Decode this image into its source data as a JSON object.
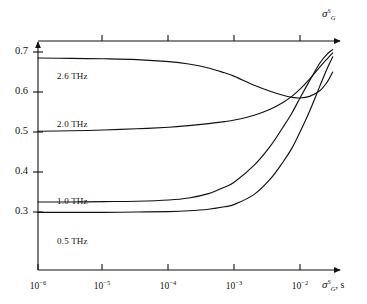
{
  "figure": {
    "background": "#ffffff",
    "line_color": "#111111",
    "axis_color": "#111111"
  },
  "axes": {
    "top_label": {
      "symbol": "σ",
      "superscript": "S",
      "subscript": "G"
    },
    "x_label": {
      "symbol": "σ",
      "superscript": "S",
      "subscript": "G",
      "unit": ", s"
    },
    "x_ticks": [
      {
        "mantissa": "10",
        "exponent": "−6",
        "value": 1e-06
      },
      {
        "mantissa": "10",
        "exponent": "−5",
        "value": 1e-05
      },
      {
        "mantissa": "10",
        "exponent": "−4",
        "value": 0.0001
      },
      {
        "mantissa": "10",
        "exponent": "−3",
        "value": 0.001
      },
      {
        "mantissa": "10",
        "exponent": "−2",
        "value": 0.01
      }
    ],
    "y_ticks": [
      "0.7",
      "0.6",
      "0.5",
      "0.4",
      "0.3"
    ]
  },
  "curve_labels": [
    {
      "text": "2.6 THz"
    },
    {
      "text": "2.0 THz"
    },
    {
      "text": "1.0 THz"
    },
    {
      "text": "0.5 THz"
    }
  ],
  "chart_data": {
    "type": "line",
    "title": "",
    "xlabel": "σ_G^S, s",
    "ylabel": "σ_G^S",
    "xscale": "log",
    "yscale": "linear",
    "xlim": [
      1e-06,
      0.0316
    ],
    "ylim": [
      0.255,
      0.725
    ],
    "grid": false,
    "legend": "inline-labels",
    "xticks": [
      1e-06,
      1e-05,
      0.0001,
      0.001,
      0.01
    ],
    "xticklabels": [
      "10^-6",
      "10^-5",
      "10^-4",
      "10^-3",
      "10^-2"
    ],
    "yticks": [
      0.3,
      0.4,
      0.5,
      0.6,
      0.7
    ],
    "yticklabels": [
      "0.3",
      "0.4",
      "0.5",
      "0.6",
      "0.7"
    ],
    "series": [
      {
        "name": "2.6 THz",
        "label": "2.6 THz",
        "x": [
          1e-06,
          3.2e-06,
          1e-05,
          3.2e-05,
          0.0001,
          0.0002,
          0.0004,
          0.0007,
          0.001,
          0.002,
          0.0035,
          0.0055,
          0.0075,
          0.01,
          0.014,
          0.02,
          0.026,
          0.0316
        ],
        "y": [
          0.685,
          0.684,
          0.683,
          0.681,
          0.676,
          0.67,
          0.66,
          0.648,
          0.639,
          0.617,
          0.602,
          0.592,
          0.587,
          0.585,
          0.589,
          0.603,
          0.625,
          0.65
        ]
      },
      {
        "name": "2.0 THz",
        "label": "2.0 THz",
        "x": [
          1e-06,
          3.2e-06,
          1e-05,
          3.2e-05,
          0.0001,
          0.0002,
          0.0004,
          0.0007,
          0.001,
          0.002,
          0.0035,
          0.0055,
          0.0075,
          0.01,
          0.014,
          0.02,
          0.026,
          0.0316
        ],
        "y": [
          0.502,
          0.503,
          0.505,
          0.508,
          0.512,
          0.516,
          0.521,
          0.526,
          0.53,
          0.542,
          0.557,
          0.574,
          0.589,
          0.607,
          0.632,
          0.662,
          0.683,
          0.698
        ]
      },
      {
        "name": "1.0 THz",
        "label": "1.0 THz",
        "x": [
          1e-06,
          3.2e-06,
          1e-05,
          3.2e-05,
          0.0001,
          0.0002,
          0.0004,
          0.0007,
          0.001,
          0.002,
          0.0035,
          0.0055,
          0.0075,
          0.01,
          0.014,
          0.02,
          0.026,
          0.0316
        ],
        "y": [
          0.325,
          0.325,
          0.326,
          0.327,
          0.33,
          0.335,
          0.346,
          0.362,
          0.375,
          0.417,
          0.464,
          0.512,
          0.547,
          0.585,
          0.628,
          0.672,
          0.695,
          0.706
        ]
      },
      {
        "name": "0.5 THz",
        "label": "0.5 THz",
        "x": [
          1e-06,
          3.2e-06,
          1e-05,
          3.2e-05,
          0.0001,
          0.0002,
          0.0004,
          0.0007,
          0.001,
          0.002,
          0.0035,
          0.0055,
          0.0075,
          0.01,
          0.014,
          0.02,
          0.026,
          0.0316
        ],
        "y": [
          0.299,
          0.299,
          0.299,
          0.3,
          0.301,
          0.303,
          0.307,
          0.313,
          0.319,
          0.344,
          0.382,
          0.425,
          0.459,
          0.5,
          0.552,
          0.614,
          0.659,
          0.688
        ]
      }
    ]
  }
}
